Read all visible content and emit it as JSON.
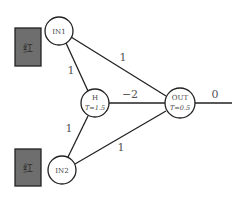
{
  "diagram": {
    "type": "neural-network",
    "inputs": [
      {
        "id": "IN1",
        "label": "IN1",
        "indicator": {
          "glyph": "红",
          "color": "#6e6e6e"
        }
      },
      {
        "id": "IN2",
        "label": "IN2",
        "indicator": {
          "glyph": "红",
          "color": "#6e6e6e"
        }
      }
    ],
    "hidden": {
      "id": "H",
      "label": "H",
      "threshold": "T=1.5"
    },
    "output": {
      "id": "OUT",
      "label": "OUT",
      "threshold": "T=0.5",
      "value": "0"
    },
    "edges": [
      {
        "from": "IN1",
        "to": "OUT",
        "weight": "1"
      },
      {
        "from": "IN1",
        "to": "H",
        "weight": "1"
      },
      {
        "from": "H",
        "to": "OUT",
        "weight": "−2"
      },
      {
        "from": "IN2",
        "to": "H",
        "weight": "1"
      },
      {
        "from": "IN2",
        "to": "OUT",
        "weight": "1"
      }
    ]
  }
}
